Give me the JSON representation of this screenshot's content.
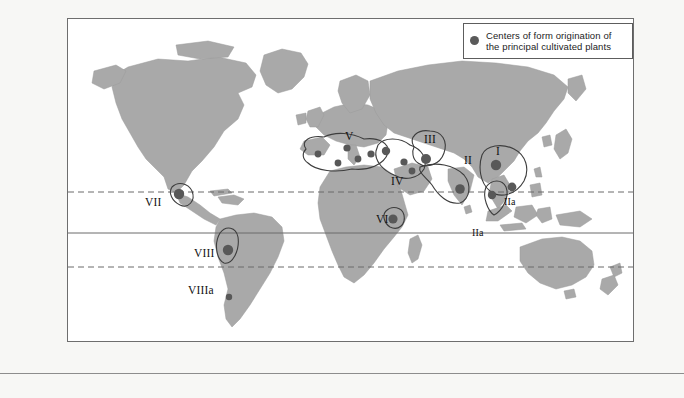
{
  "figure": {
    "type": "world-map",
    "caption": "",
    "legend": {
      "marker": "filled-circle",
      "marker_color": "#5a5a5a",
      "line1": "Centers of form origination of",
      "line2": "the principal cultivated plants"
    },
    "colors": {
      "land": "#a9a9a9",
      "land_stroke": "#8e8e8e",
      "ocean": "#ffffff",
      "region_outline": "#3d3d3d",
      "center_dot": "#585858",
      "latitude_dashed": "#6a6a6a",
      "equator": "#6a6a6a",
      "frame": "#6e6e6e",
      "background": "#f7f7f5"
    },
    "latitude_lines": [
      {
        "name": "Tropic of Cancer",
        "style": "dashed",
        "y": 173
      },
      {
        "name": "Equator",
        "style": "solid",
        "y": 214
      },
      {
        "name": "Tropic of Capricorn",
        "style": "dashed",
        "y": 248
      }
    ],
    "region_labels": [
      {
        "id": "V",
        "text": "V",
        "x": 277,
        "y": 118,
        "region": "Mediterranean"
      },
      {
        "id": "III",
        "text": "III",
        "x": 359,
        "y": 121,
        "region": "Central Asia"
      },
      {
        "id": "II",
        "text": "II",
        "x": 398,
        "y": 142,
        "region": "India"
      },
      {
        "id": "I",
        "text": "I",
        "x": 428,
        "y": 133,
        "region": "China"
      },
      {
        "id": "IV",
        "text": "IV",
        "x": 325,
        "y": 163,
        "region": "Near East"
      },
      {
        "id": "VI",
        "text": "VI",
        "x": 311,
        "y": 201,
        "region": "Ethiopia"
      },
      {
        "id": "IIa-1",
        "text": "IIa",
        "x": 437,
        "y": 183,
        "region": "Indo-Malayan"
      },
      {
        "id": "IIa-2",
        "text": "IIa",
        "x": 405,
        "y": 214,
        "region": "Indo-Malayan"
      },
      {
        "id": "VII",
        "text": "VII",
        "x": 79,
        "y": 184,
        "region": "Mexico / Central America"
      },
      {
        "id": "VIII",
        "text": "VIII",
        "x": 128,
        "y": 235,
        "region": "Andes / South America"
      },
      {
        "id": "VIIIa",
        "text": "VIIIa",
        "x": 122,
        "y": 272,
        "region": "Chile"
      }
    ],
    "origination_centers": [
      {
        "region": "VII",
        "x": 111,
        "y": 175
      },
      {
        "region": "VIII",
        "x": 160,
        "y": 231
      },
      {
        "region": "VIIIa",
        "x": 161,
        "y": 278
      },
      {
        "region": "V",
        "x": 250,
        "y": 135
      },
      {
        "region": "V",
        "x": 279,
        "y": 129
      },
      {
        "region": "V",
        "x": 290,
        "y": 140
      },
      {
        "region": "V",
        "x": 270,
        "y": 144
      },
      {
        "region": "V",
        "x": 303,
        "y": 135
      },
      {
        "region": "IV",
        "x": 318,
        "y": 132
      },
      {
        "region": "IV",
        "x": 336,
        "y": 143
      },
      {
        "region": "IV",
        "x": 344,
        "y": 152
      },
      {
        "region": "VI",
        "x": 325,
        "y": 200
      },
      {
        "region": "III",
        "x": 358,
        "y": 140
      },
      {
        "region": "II",
        "x": 392,
        "y": 170
      },
      {
        "region": "I",
        "x": 428,
        "y": 146
      },
      {
        "region": "I",
        "x": 444,
        "y": 168
      },
      {
        "region": "IIa",
        "x": 424,
        "y": 176
      }
    ]
  }
}
